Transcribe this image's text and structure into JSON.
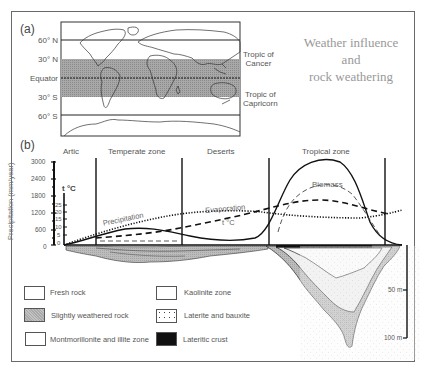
{
  "title": {
    "line1": "Weather influence",
    "line2": "and",
    "line3": "rock weathering"
  },
  "panel_a": {
    "label": "(a)",
    "latitudes": [
      "60° N",
      "30° N",
      "Equator",
      "30° S",
      "60° S"
    ],
    "tropic_cancer_line1": "Tropic of",
    "tropic_cancer_line2": "Cancer",
    "tropic_capricorn_line1": "Tropic of",
    "tropic_capricorn_line2": "Capricorn"
  },
  "panel_b": {
    "label": "(b)",
    "zones": [
      "Artic",
      "Temperate zone",
      "Deserts",
      "Tropical zone"
    ],
    "y_axis_label": "Precipitation (mm/year)",
    "y_ticks": [
      "3000",
      "2400",
      "1800",
      "1200",
      "600",
      "0"
    ],
    "temp_axis_label": "t °C",
    "temp_ticks": [
      "25",
      "20",
      "15",
      "10",
      "5",
      "0"
    ],
    "curve_labels": {
      "precipitation": "Precipitation",
      "evaporation": "Evaporation",
      "temperature": "t °C",
      "biomass": "Biomass"
    },
    "depth_ticks": [
      "50 m",
      "100 m"
    ]
  },
  "legend": [
    {
      "label": "Fresh rock",
      "pattern": "plain"
    },
    {
      "label": "Slightly weathered rock",
      "pattern": "gray"
    },
    {
      "label": "Montmorillonite and illite zone",
      "pattern": "plain"
    },
    {
      "label": "Kaolinite zone",
      "pattern": "plain"
    },
    {
      "label": "Laterite and bauxite",
      "pattern": "dots"
    },
    {
      "label": "Lateritic crust",
      "pattern": "black"
    }
  ],
  "colors": {
    "tropical_band": "#9a9a9a",
    "weathered": "#b8b8b8",
    "laterite": "#f2f2f2",
    "crust": "#111111"
  }
}
